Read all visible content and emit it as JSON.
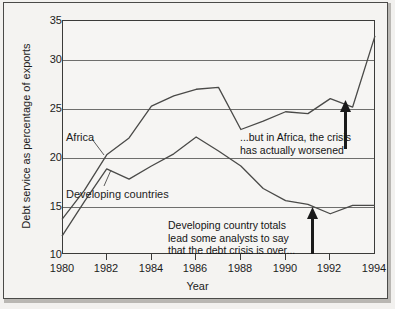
{
  "chart_data": {
    "type": "line",
    "title": "",
    "xlabel": "Year",
    "ylabel": "Debt service as percentage of exports",
    "xlim": [
      1980,
      1994
    ],
    "ylim": [
      10,
      35
    ],
    "yticks": [
      10,
      15,
      20,
      25,
      30,
      35
    ],
    "xticks": [
      1980,
      1982,
      1984,
      1986,
      1988,
      1990,
      1992,
      1994
    ],
    "grid": true,
    "legend": "inline-labels",
    "x": [
      1980,
      1981,
      1982,
      1983,
      1984,
      1985,
      1986,
      1987,
      1988,
      1989,
      1990,
      1991,
      1992,
      1993,
      1994
    ],
    "series": [
      {
        "name": "Africa",
        "values": [
          13.7,
          16.8,
          20.6,
          22.4,
          25.8,
          26.9,
          27.6,
          27.8,
          23.3,
          24.2,
          25.2,
          25.0,
          26.6,
          25.7,
          33.3
        ]
      },
      {
        "name": "Developing countries",
        "values": [
          11.9,
          15.6,
          19.1,
          18.0,
          19.4,
          20.7,
          22.5,
          21.0,
          19.4,
          17.0,
          15.7,
          15.3,
          14.3,
          15.2,
          15.2
        ]
      }
    ],
    "annotations": [
      {
        "id": "africa-annotation",
        "lines": [
          "...but in Africa, the crisis",
          "has actually worsened"
        ],
        "arrow": "up",
        "arrow_at_year": 1993
      },
      {
        "id": "developing-annotation",
        "lines": [
          "Developing country totals",
          "lead some analysts to say",
          "that the debt crisis is over..."
        ],
        "arrow": "up",
        "arrow_at_year": 1991
      }
    ],
    "ytick_labels": [
      "35",
      "30",
      "25",
      "20",
      "15",
      "10"
    ],
    "xtick_labels": [
      "1980",
      "1982",
      "1984",
      "1986",
      "1988",
      "1990",
      "1992",
      "1994"
    ]
  },
  "labels": {
    "series_africa": "Africa",
    "series_developing": "Developing countries",
    "axis_x": "Year",
    "axis_y": "Debt service as percentage of exports",
    "annotation_africa_line1": "...but in Africa, the crisis",
    "annotation_africa_line2": "has actually worsened",
    "annotation_dev_line1": "Developing country totals",
    "annotation_dev_line2": "lead some analysts to say",
    "annotation_dev_line3": "that the debt crisis is over..."
  },
  "colors": {
    "line": "#4a4a48",
    "grid": "#6e6e6c",
    "frame": "#3b3b39",
    "background": "#f4f3f1",
    "text": "#1c1c1c"
  }
}
